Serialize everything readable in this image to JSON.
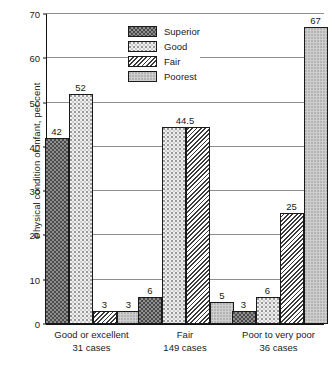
{
  "chart_data": {
    "type": "bar",
    "title": "",
    "subtitle": "",
    "xlabel": "",
    "ylabel": "Physical condition of infant, per cent",
    "ylim": [
      0,
      70
    ],
    "yticks": [
      0,
      10,
      20,
      30,
      40,
      50,
      60,
      70
    ],
    "grid": true,
    "grid_axis": "y",
    "legend_position": "top-center-inside",
    "categories": [
      "Good or excellent 31 cases",
      "Fair 149 cases",
      "Poor to very poor 36 cases"
    ],
    "series": [
      {
        "name": "Superior",
        "values": [
          42,
          6,
          3
        ]
      },
      {
        "name": "Good",
        "values": [
          52,
          44.5,
          6
        ]
      },
      {
        "name": "Fair",
        "values": [
          3,
          44.5,
          25
        ]
      },
      {
        "name": "Poorest",
        "values": [
          3,
          5,
          67
        ]
      }
    ]
  },
  "axis": {
    "y_title": "Physical condition of infant, per cent",
    "y_ticks": [
      "70",
      "60",
      "50",
      "40",
      "30",
      "20",
      "10",
      "0"
    ]
  },
  "legend": {
    "items": [
      {
        "label": "Superior",
        "pattern": "dark-dotted-swatch"
      },
      {
        "label": "Good",
        "pattern": "light-dotted-swatch"
      },
      {
        "label": "Fair",
        "pattern": "diagonal-hatch-swatch"
      },
      {
        "label": "Poorest",
        "pattern": "gray-stipple-swatch"
      }
    ]
  },
  "groups": [
    {
      "line1": "Good or excellent",
      "line2": "31 cases",
      "bars": [
        {
          "series": "Superior",
          "value": 42,
          "label": "42"
        },
        {
          "series": "Good",
          "value": 52,
          "label": "52"
        },
        {
          "series": "Fair",
          "value": 3,
          "label": "3"
        },
        {
          "series": "Poorest",
          "value": 3,
          "label": "3"
        }
      ]
    },
    {
      "line1": "Fair",
      "line2": "149 cases",
      "bars": [
        {
          "series": "Superior",
          "value": 6,
          "label": "6"
        },
        {
          "series": "Good",
          "value": 44.5,
          "label": "44.5"
        },
        {
          "series": "Fair",
          "value": 44.5,
          "label": ""
        },
        {
          "series": "Poorest",
          "value": 5,
          "label": "5"
        }
      ]
    },
    {
      "line1": "Poor to very poor",
      "line2": "36 cases",
      "bars": [
        {
          "series": "Superior",
          "value": 3,
          "label": "3"
        },
        {
          "series": "Good",
          "value": 6,
          "label": "6"
        },
        {
          "series": "Fair",
          "value": 25,
          "label": "25"
        },
        {
          "series": "Poorest",
          "value": 67,
          "label": "67"
        }
      ]
    }
  ]
}
